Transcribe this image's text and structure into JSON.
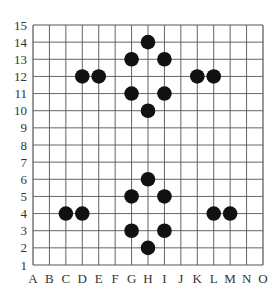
{
  "board": {
    "columns": [
      "A",
      "B",
      "C",
      "D",
      "E",
      "F",
      "G",
      "H",
      "I",
      "J",
      "K",
      "L",
      "M",
      "N",
      "O"
    ],
    "rows": [
      "1",
      "2",
      "3",
      "4",
      "5",
      "6",
      "7",
      "8",
      "9",
      "10",
      "11",
      "12",
      "13",
      "14",
      "15"
    ],
    "line_color": "#555555",
    "stone_color": "#111111",
    "background": "#ffffff"
  },
  "stones": [
    {
      "col": "D",
      "row": 12,
      "color": "black"
    },
    {
      "col": "E",
      "row": 12,
      "color": "black"
    },
    {
      "col": "G",
      "row": 13,
      "color": "black"
    },
    {
      "col": "G",
      "row": 11,
      "color": "black"
    },
    {
      "col": "H",
      "row": 14,
      "color": "black"
    },
    {
      "col": "H",
      "row": 10,
      "color": "black"
    },
    {
      "col": "I",
      "row": 13,
      "color": "black"
    },
    {
      "col": "I",
      "row": 11,
      "color": "black"
    },
    {
      "col": "K",
      "row": 12,
      "color": "black"
    },
    {
      "col": "L",
      "row": 12,
      "color": "black"
    },
    {
      "col": "C",
      "row": 4,
      "color": "black"
    },
    {
      "col": "D",
      "row": 4,
      "color": "black"
    },
    {
      "col": "G",
      "row": 5,
      "color": "black"
    },
    {
      "col": "G",
      "row": 3,
      "color": "black"
    },
    {
      "col": "H",
      "row": 6,
      "color": "black"
    },
    {
      "col": "H",
      "row": 2,
      "color": "black"
    },
    {
      "col": "I",
      "row": 5,
      "color": "black"
    },
    {
      "col": "I",
      "row": 3,
      "color": "black"
    },
    {
      "col": "L",
      "row": 4,
      "color": "black"
    },
    {
      "col": "M",
      "row": 4,
      "color": "black"
    }
  ]
}
